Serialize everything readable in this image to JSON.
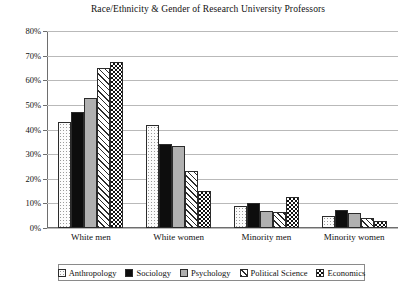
{
  "chart_data": {
    "type": "bar",
    "title": "Race/Ethnicity & Gender of Research University Professors",
    "xlabel": "",
    "ylabel": "",
    "ylim": [
      0,
      80
    ],
    "grid": true,
    "legend_position": "bottom",
    "ytick_labels": [
      "80%",
      "70%",
      "60%",
      "50%",
      "40%",
      "30%",
      "20%",
      "10%",
      "0%"
    ],
    "ytick_values": [
      80,
      70,
      60,
      50,
      40,
      30,
      20,
      10,
      0
    ],
    "categories": [
      "White men",
      "White women",
      "Minority men",
      "Minority women"
    ],
    "series": [
      {
        "name": "Anthropology",
        "pattern": "dotted",
        "values": [
          43,
          42,
          9,
          5
        ]
      },
      {
        "name": "Sociology",
        "pattern": "solid-black",
        "values": [
          47,
          34,
          10,
          7.5
        ]
      },
      {
        "name": "Psychology",
        "pattern": "solid-gray",
        "values": [
          53,
          33.5,
          7,
          6
        ]
      },
      {
        "name": "Political Science",
        "pattern": "diagonal",
        "values": [
          65,
          23,
          6.5,
          4
        ]
      },
      {
        "name": "Economics",
        "pattern": "checkered",
        "values": [
          67.5,
          15,
          12.5,
          3
        ]
      }
    ]
  }
}
